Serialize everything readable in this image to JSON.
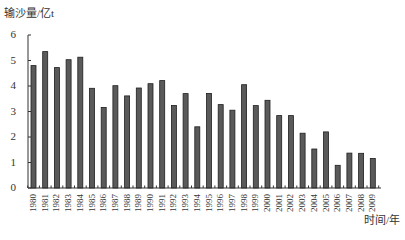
{
  "chart_data": {
    "type": "bar",
    "title": "",
    "ylabel": "输沙量/亿t",
    "xlabel": "时间/年",
    "ylim": [
      0,
      6
    ],
    "yticks": [
      0,
      1,
      2,
      3,
      4,
      5,
      6
    ],
    "grid": false,
    "legend": null,
    "categories": [
      "1980",
      "1981",
      "1982",
      "1983",
      "1984",
      "1985",
      "1986",
      "1987",
      "1988",
      "1989",
      "1990",
      "1991",
      "1992",
      "1993",
      "1994",
      "1995",
      "1996",
      "1997",
      "1998",
      "1999",
      "2000",
      "2001",
      "2002",
      "2003",
      "2004",
      "2005",
      "2006",
      "2007",
      "2008",
      "2009"
    ],
    "values": [
      4.8,
      5.35,
      4.72,
      5.03,
      5.13,
      3.91,
      3.16,
      4.01,
      3.61,
      3.92,
      4.09,
      4.21,
      3.24,
      3.7,
      2.4,
      3.71,
      3.27,
      3.05,
      4.05,
      3.23,
      3.44,
      2.84,
      2.84,
      2.15,
      1.53,
      2.2,
      0.89,
      1.37,
      1.36,
      1.16
    ],
    "colors": {
      "bar_fill": "#5a5a5a",
      "bar_stroke": "#1e1e1e",
      "axis": "#333333"
    }
  }
}
